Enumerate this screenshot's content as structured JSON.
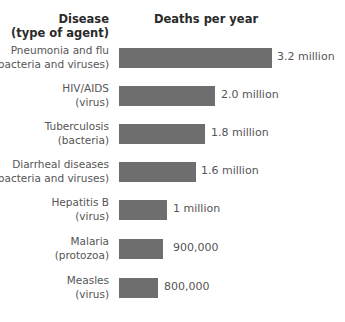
{
  "header": {
    "left_line1": "Disease",
    "left_line2": "(type of agent)",
    "right": "Deaths per year"
  },
  "rows": [
    {
      "name": "Pneumonia and flu",
      "agent": "(bacteria and viruses)",
      "value_label": "3.2 million",
      "top": 44,
      "bar_width": 153,
      "label_left": 277
    },
    {
      "name": "HIV/AIDS",
      "agent": "(virus)",
      "value_label": "2.0 million",
      "top": 82,
      "bar_width": 96,
      "label_left": 221
    },
    {
      "name": "Tuberculosis",
      "agent": "(bacteria)",
      "value_label": "1.8 million",
      "top": 120,
      "bar_width": 86,
      "label_left": 211
    },
    {
      "name": "Diarrheal diseases",
      "agent": "(bacteria and viruses)",
      "value_label": "1.6 million",
      "top": 158,
      "bar_width": 77,
      "label_left": 201
    },
    {
      "name": "Hepatitis B",
      "agent": "(virus)",
      "value_label": "1 million",
      "top": 196,
      "bar_width": 48,
      "label_left": 173
    },
    {
      "name": "Malaria",
      "agent": "(protozoa)",
      "value_label": "900,000",
      "top": 235,
      "bar_width": 44,
      "label_left": 173
    },
    {
      "name": "Measles",
      "agent": "(virus)",
      "value_label": "800,000",
      "top": 274,
      "bar_width": 39,
      "label_left": 164
    }
  ],
  "colors": {
    "bar": "#6e6e6e"
  },
  "chart_data": {
    "type": "bar",
    "orientation": "horizontal",
    "title": "",
    "xlabel": "Deaths per year",
    "ylabel": "Disease (type of agent)",
    "categories": [
      "Pneumonia and flu (bacteria and viruses)",
      "HIV/AIDS (virus)",
      "Tuberculosis (bacteria)",
      "Diarrheal diseases (bacteria and viruses)",
      "Hepatitis B (virus)",
      "Malaria (protozoa)",
      "Measles (virus)"
    ],
    "values": [
      3200000,
      2000000,
      1800000,
      1600000,
      1000000,
      900000,
      800000
    ],
    "data_labels": [
      "3.2 million",
      "2.0 million",
      "1.8 million",
      "1.6 million",
      "1 million",
      "900,000",
      "800,000"
    ],
    "grid": false,
    "legend": null
  }
}
